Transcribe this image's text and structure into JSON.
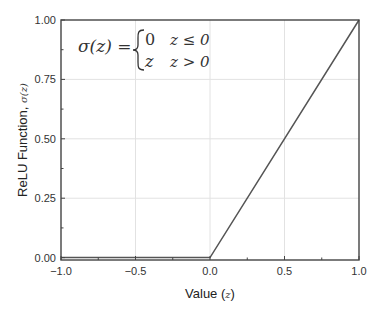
{
  "chart_data": {
    "type": "line",
    "title": "",
    "xlabel": "Value",
    "xlabel_math": "z",
    "ylabel": "ReLU Function,",
    "ylabel_math": "σ(z)",
    "xlim": [
      -1.0,
      1.0
    ],
    "ylim": [
      -0.01,
      1.0
    ],
    "xticks": [
      "-1.0",
      "-0.5",
      "0.0",
      "0.5",
      "1.0"
    ],
    "yticks": [
      "0.00",
      "0.25",
      "0.50",
      "0.75",
      "1.00"
    ],
    "grid": true,
    "legend": null,
    "series": [
      {
        "name": "ReLU",
        "color": "#555555",
        "x": [
          -1.0,
          0.0,
          1.0
        ],
        "y": [
          0.0,
          0.0,
          1.0
        ]
      }
    ],
    "annotations": [
      {
        "type": "equation",
        "lhs": "σ(z) =",
        "cases": [
          {
            "value": "0",
            "condition": "z ≤ 0"
          },
          {
            "value": "z",
            "condition": "z > 0"
          }
        ]
      }
    ]
  },
  "labels": {
    "x_title": "Value (",
    "x_title_var": "z",
    "x_title_end": ")",
    "y_title": "ReLU Function, ",
    "y_title_var": "σ(z)",
    "eq_lhs": "σ(z) =",
    "eq_case1_val": "0",
    "eq_case1_cond": "z ≤ 0",
    "eq_case2_val": "z",
    "eq_case2_cond": "z > 0"
  },
  "colors": {
    "line": "#555555",
    "frame": "#444444",
    "grid": "#e2e2e2"
  }
}
